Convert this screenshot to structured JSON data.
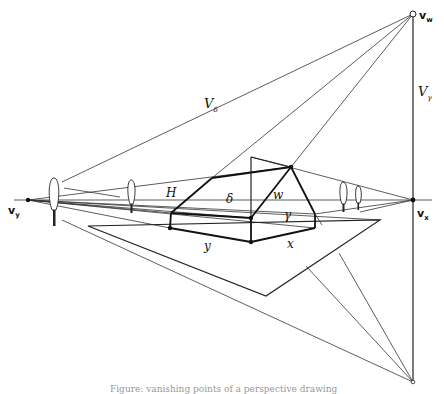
{
  "figure": {
    "labels": {
      "vw": {
        "main": "v",
        "sub": "w"
      },
      "vx": {
        "main": "v",
        "sub": "x"
      },
      "vy": {
        "main": "v",
        "sub": "y"
      },
      "V_delta": {
        "main": "V",
        "sub": "δ"
      },
      "V_gamma": {
        "main": "V",
        "sub": "γ"
      },
      "H": "H",
      "delta": "δ",
      "gamma": "γ",
      "w": "w",
      "x": "x",
      "y": "y"
    },
    "points": {
      "vy": [
        28,
        200
      ],
      "vx": [
        413,
        200
      ],
      "vw": [
        413,
        14
      ],
      "v_bottom": [
        413,
        382
      ],
      "house_front_bottom": [
        251,
        242
      ],
      "house_front_top": [
        251,
        218
      ],
      "house_left_bottom": [
        170,
        228
      ],
      "house_left_top": [
        171,
        213
      ],
      "house_right_bottom": [
        315,
        228
      ],
      "house_right_top": [
        315,
        214
      ],
      "roof_peak": [
        291,
        167
      ],
      "roof_back_top": [
        251,
        157
      ],
      "plane_left": [
        88,
        226
      ],
      "plane_right": [
        380,
        220
      ],
      "plane_bottom": [
        266,
        296
      ]
    },
    "caption": "Figure: vanishing points of a perspective drawing"
  }
}
